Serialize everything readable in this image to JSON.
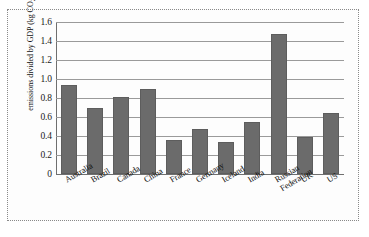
{
  "chart_data": {
    "type": "bar",
    "title": "",
    "xlabel": "",
    "ylabel": "emissions divided by GDP (kg CO2e/$)",
    "ylabel_parts": {
      "prefix": "emissions divided by GDP (kg CO",
      "subscript": "2",
      "suffix": "e/$)"
    },
    "categories": [
      "Australia",
      "Brazil",
      "Canada",
      "China",
      "France",
      "Germany",
      "Iceland",
      "Russian\nFederation",
      "India",
      "UK",
      "US"
    ],
    "category_labels": [
      "Australia",
      "Brazil",
      "Canada",
      "China",
      "France",
      "Germany",
      "Iceland",
      "India",
      "Russian\nFederation",
      "UK",
      "US"
    ],
    "values": [
      0.94,
      0.7,
      0.81,
      0.9,
      0.36,
      0.47,
      0.34,
      0.55,
      1.47,
      0.39,
      0.64
    ],
    "ylim": [
      0,
      1.6
    ],
    "yticks": [
      0,
      0.2,
      0.4,
      0.6,
      0.8,
      1.0,
      1.2,
      1.4,
      1.6
    ],
    "ytick_labels": [
      "0",
      "0.2",
      "0.4",
      "0.6",
      "0.8",
      "1.0",
      "1.2",
      "1.4",
      "1.6"
    ],
    "grid": true,
    "legend": null,
    "bar_color": "#6b6b6b",
    "gridline_color": "#9a9a9a",
    "axis_color": "#6f6f6f"
  }
}
